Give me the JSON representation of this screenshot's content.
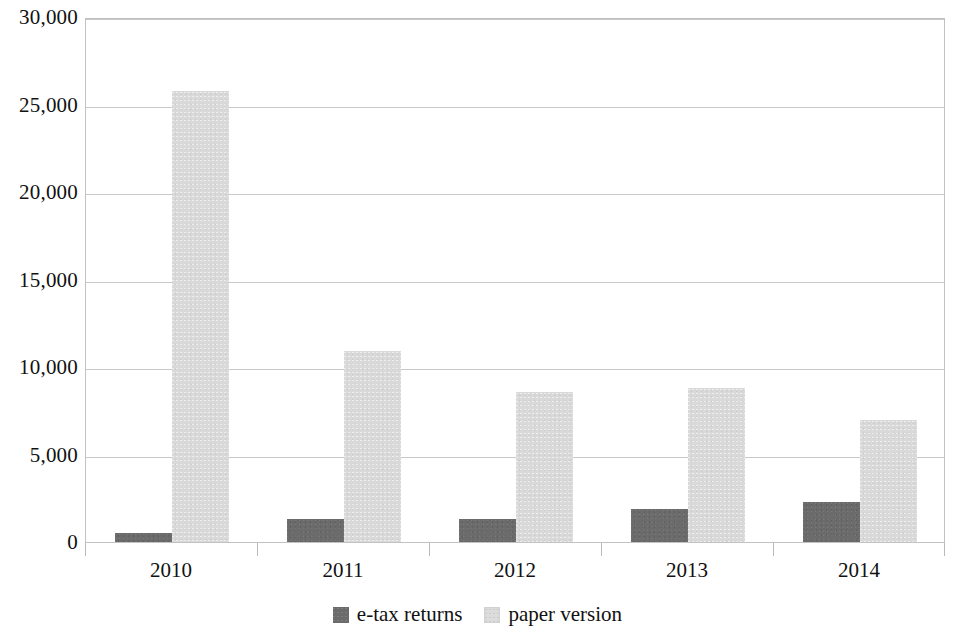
{
  "chart_data": {
    "type": "bar",
    "title": "",
    "subtitle": "",
    "xlabel": "",
    "ylabel": "",
    "categories": [
      "2010",
      "2011",
      "2012",
      "2013",
      "2014"
    ],
    "series": [
      {
        "name": "e-tax returns",
        "color": "#6b6b6b",
        "values": [
          500,
          1300,
          1300,
          1900,
          2300
        ]
      },
      {
        "name": "paper version",
        "color": "#d9d9d9",
        "values": [
          25800,
          10900,
          8600,
          8800,
          6950
        ]
      }
    ],
    "ylim": [
      0,
      30000
    ],
    "ytick_values": [
      0,
      5000,
      10000,
      15000,
      20000,
      25000,
      30000
    ],
    "ytick_labels": [
      "0",
      "5,000",
      "10,000",
      "15,000",
      "20,000",
      "25,000",
      "30,000"
    ],
    "grid": true,
    "grid_axis": "y",
    "legend_position": "bottom-center"
  },
  "legend": {
    "items": [
      {
        "label": "e-tax returns",
        "swatch": "dark-gray-square"
      },
      {
        "label": "paper version",
        "swatch": "light-gray-square"
      }
    ]
  }
}
